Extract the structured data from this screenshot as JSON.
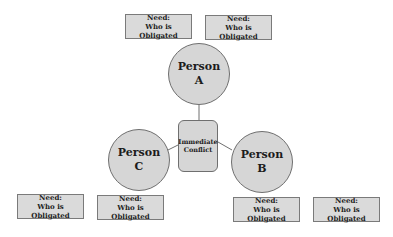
{
  "colors": {
    "fill": "#d6d6d6",
    "box_fill": "#dadada",
    "stroke": "#6f6f6f",
    "text": "#1c1c1c"
  },
  "center": {
    "line1": "Immediate",
    "line2": "Conflict"
  },
  "persons": [
    {
      "id": "A",
      "line1": "Person",
      "line2": "A"
    },
    {
      "id": "B",
      "line1": "Person",
      "line2": "B"
    },
    {
      "id": "C",
      "line1": "Person",
      "line2": "C"
    }
  ],
  "need_boxes": {
    "a_left": {
      "line1": "Need:",
      "line2": "Who is Obligated"
    },
    "a_right": {
      "line1": "Need:",
      "line2": "Who is Obligated"
    },
    "c_left": {
      "line1": "Need:",
      "line2": "Who is Obligated"
    },
    "c_right": {
      "line1": "Need:",
      "line2": "Who is Obligated"
    },
    "b_left": {
      "line1": "Need:",
      "line2": "Who is Obligated"
    },
    "b_right": {
      "line1": "Need:",
      "line2": "Who is Obligated"
    }
  }
}
